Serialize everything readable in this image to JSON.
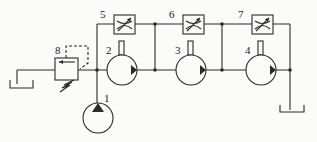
{
  "diagram": {
    "type": "hydraulic-schematic",
    "colors": {
      "line": "#2a2a2a",
      "background": "#fbfbfa"
    },
    "components": [
      {
        "id": "1",
        "label": "1",
        "kind": "pump"
      },
      {
        "id": "2",
        "label": "2",
        "kind": "hydraulic-motor"
      },
      {
        "id": "3",
        "label": "3",
        "kind": "hydraulic-motor"
      },
      {
        "id": "4",
        "label": "4",
        "kind": "hydraulic-motor"
      },
      {
        "id": "5",
        "label": "5",
        "kind": "throttle-valve"
      },
      {
        "id": "6",
        "label": "6",
        "kind": "throttle-valve"
      },
      {
        "id": "7",
        "label": "7",
        "kind": "throttle-valve"
      },
      {
        "id": "8",
        "label": "8",
        "kind": "relief-valve"
      }
    ]
  }
}
